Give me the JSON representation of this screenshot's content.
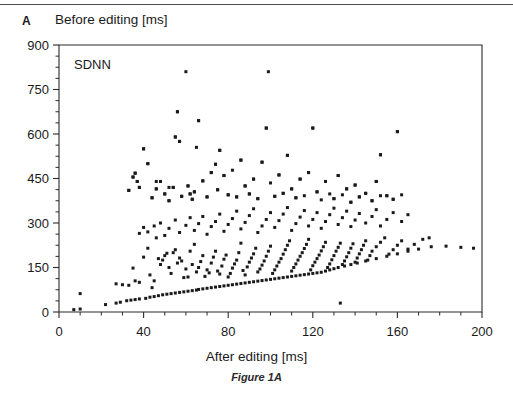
{
  "figure": {
    "panel_letter": "A",
    "caption": "Figure 1A",
    "series_label": "SDNN",
    "y_axis_title": "Before editing [ms]",
    "x_axis_title": "After editing [ms]"
  },
  "chart_data": {
    "type": "scatter",
    "title": "Before editing [ms]",
    "xlabel": "After editing [ms]",
    "ylabel": "Before editing [ms]",
    "series_name": "SDNN",
    "xlim": [
      0,
      200
    ],
    "ylim": [
      0,
      900
    ],
    "xticks": [
      0,
      40,
      80,
      120,
      160,
      200
    ],
    "yticks": [
      0,
      150,
      300,
      450,
      600,
      750,
      900
    ],
    "x_minor_tick_interval": 10,
    "y_minor_tick_interval": 37.5,
    "grid": false,
    "legend": "none",
    "marker": "square",
    "marker_color": "#1a1a1a",
    "marker_size_px": 3,
    "points": [
      [
        7,
        8
      ],
      [
        10,
        10
      ],
      [
        10,
        62
      ],
      [
        22,
        25
      ],
      [
        27,
        30
      ],
      [
        29,
        33
      ],
      [
        32,
        38
      ],
      [
        34,
        40
      ],
      [
        36,
        42
      ],
      [
        38,
        44
      ],
      [
        41,
        46
      ],
      [
        43,
        50
      ],
      [
        45,
        52
      ],
      [
        47,
        55
      ],
      [
        49,
        58
      ],
      [
        51,
        60
      ],
      [
        53,
        62
      ],
      [
        55,
        64
      ],
      [
        57,
        66
      ],
      [
        59,
        68
      ],
      [
        61,
        70
      ],
      [
        63,
        72
      ],
      [
        65,
        74
      ],
      [
        66,
        76
      ],
      [
        68,
        78
      ],
      [
        70,
        80
      ],
      [
        72,
        82
      ],
      [
        74,
        84
      ],
      [
        76,
        86
      ],
      [
        78,
        88
      ],
      [
        80,
        90
      ],
      [
        82,
        92
      ],
      [
        84,
        94
      ],
      [
        86,
        96
      ],
      [
        88,
        98
      ],
      [
        90,
        100
      ],
      [
        92,
        102
      ],
      [
        94,
        104
      ],
      [
        96,
        106
      ],
      [
        98,
        108
      ],
      [
        100,
        110
      ],
      [
        102,
        112
      ],
      [
        104,
        114
      ],
      [
        106,
        116
      ],
      [
        108,
        118
      ],
      [
        110,
        120
      ],
      [
        112,
        122
      ],
      [
        114,
        124
      ],
      [
        116,
        126
      ],
      [
        118,
        128
      ],
      [
        120,
        130
      ],
      [
        122,
        132
      ],
      [
        124,
        134
      ],
      [
        126,
        138
      ],
      [
        128,
        142
      ],
      [
        130,
        146
      ],
      [
        132,
        150
      ],
      [
        135,
        155
      ],
      [
        138,
        160
      ],
      [
        141,
        165
      ],
      [
        145,
        172
      ],
      [
        150,
        180
      ],
      [
        155,
        188
      ],
      [
        160,
        196
      ],
      [
        165,
        205
      ],
      [
        170,
        212
      ],
      [
        176,
        220
      ],
      [
        183,
        222
      ],
      [
        190,
        218
      ],
      [
        196,
        215
      ],
      [
        27,
        95
      ],
      [
        30,
        92
      ],
      [
        33,
        90
      ],
      [
        35,
        148
      ],
      [
        36,
        105
      ],
      [
        38,
        100
      ],
      [
        40,
        185
      ],
      [
        42,
        215
      ],
      [
        43,
        125
      ],
      [
        44,
        82
      ],
      [
        45,
        105
      ],
      [
        46,
        250
      ],
      [
        47,
        180
      ],
      [
        48,
        160
      ],
      [
        49,
        175
      ],
      [
        50,
        190
      ],
      [
        51,
        198
      ],
      [
        52,
        150
      ],
      [
        53,
        130
      ],
      [
        54,
        200
      ],
      [
        55,
        210
      ],
      [
        56,
        165
      ],
      [
        57,
        182
      ],
      [
        58,
        172
      ],
      [
        59,
        116
      ],
      [
        60,
        145
      ],
      [
        61,
        118
      ],
      [
        62,
        205
      ],
      [
        63,
        160
      ],
      [
        64,
        228
      ],
      [
        65,
        135
      ],
      [
        66,
        150
      ],
      [
        67,
        170
      ],
      [
        68,
        190
      ],
      [
        69,
        120
      ],
      [
        70,
        142
      ],
      [
        71,
        132
      ],
      [
        72,
        165
      ],
      [
        73,
        185
      ],
      [
        74,
        205
      ],
      [
        75,
        138
      ],
      [
        76,
        128
      ],
      [
        77,
        155
      ],
      [
        78,
        178
      ],
      [
        79,
        192
      ],
      [
        80,
        118
      ],
      [
        81,
        130
      ],
      [
        82,
        148
      ],
      [
        83,
        162
      ],
      [
        84,
        175
      ],
      [
        85,
        200
      ],
      [
        86,
        232
      ],
      [
        87,
        140
      ],
      [
        88,
        125
      ],
      [
        89,
        152
      ],
      [
        90,
        168
      ],
      [
        91,
        182
      ],
      [
        92,
        196
      ],
      [
        93,
        215
      ],
      [
        94,
        135
      ],
      [
        95,
        145
      ],
      [
        96,
        158
      ],
      [
        97,
        172
      ],
      [
        98,
        188
      ],
      [
        99,
        205
      ],
      [
        100,
        222
      ],
      [
        101,
        130
      ],
      [
        102,
        142
      ],
      [
        103,
        155
      ],
      [
        104,
        168
      ],
      [
        105,
        180
      ],
      [
        106,
        195
      ],
      [
        107,
        210
      ],
      [
        108,
        225
      ],
      [
        109,
        240
      ],
      [
        110,
        138
      ],
      [
        111,
        150
      ],
      [
        112,
        162
      ],
      [
        113,
        175
      ],
      [
        114,
        188
      ],
      [
        115,
        200
      ],
      [
        116,
        214
      ],
      [
        117,
        228
      ],
      [
        118,
        245
      ],
      [
        119,
        142
      ],
      [
        120,
        156
      ],
      [
        121,
        168
      ],
      [
        122,
        180
      ],
      [
        123,
        192
      ],
      [
        124,
        206
      ],
      [
        125,
        220
      ],
      [
        126,
        235
      ],
      [
        127,
        150
      ],
      [
        128,
        162
      ],
      [
        129,
        176
      ],
      [
        130,
        190
      ],
      [
        131,
        205
      ],
      [
        132,
        218
      ],
      [
        133,
        232
      ],
      [
        134,
        160
      ],
      [
        135,
        172
      ],
      [
        136,
        186
      ],
      [
        137,
        200
      ],
      [
        138,
        215
      ],
      [
        139,
        230
      ],
      [
        140,
        168
      ],
      [
        141,
        182
      ],
      [
        142,
        196
      ],
      [
        143,
        210
      ],
      [
        144,
        225
      ],
      [
        145,
        240
      ],
      [
        146,
        175
      ],
      [
        147,
        190
      ],
      [
        148,
        205
      ],
      [
        150,
        220
      ],
      [
        152,
        235
      ],
      [
        154,
        250
      ],
      [
        156,
        195
      ],
      [
        158,
        210
      ],
      [
        160,
        225
      ],
      [
        162,
        240
      ],
      [
        165,
        212
      ],
      [
        168,
        228
      ],
      [
        172,
        245
      ],
      [
        175,
        250
      ],
      [
        38,
        265
      ],
      [
        40,
        285
      ],
      [
        42,
        270
      ],
      [
        45,
        290
      ],
      [
        48,
        300
      ],
      [
        50,
        258
      ],
      [
        52,
        282
      ],
      [
        55,
        310
      ],
      [
        57,
        268
      ],
      [
        60,
        292
      ],
      [
        62,
        318
      ],
      [
        64,
        275
      ],
      [
        66,
        298
      ],
      [
        68,
        322
      ],
      [
        70,
        262
      ],
      [
        72,
        288
      ],
      [
        74,
        305
      ],
      [
        76,
        330
      ],
      [
        78,
        272
      ],
      [
        80,
        295
      ],
      [
        82,
        315
      ],
      [
        84,
        340
      ],
      [
        86,
        280
      ],
      [
        88,
        302
      ],
      [
        90,
        325
      ],
      [
        92,
        348
      ],
      [
        94,
        268
      ],
      [
        96,
        290
      ],
      [
        98,
        312
      ],
      [
        100,
        335
      ],
      [
        102,
        285
      ],
      [
        104,
        308
      ],
      [
        106,
        330
      ],
      [
        108,
        352
      ],
      [
        110,
        275
      ],
      [
        112,
        298
      ],
      [
        114,
        320
      ],
      [
        116,
        342
      ],
      [
        118,
        290
      ],
      [
        120,
        312
      ],
      [
        122,
        335
      ],
      [
        124,
        282
      ],
      [
        126,
        305
      ],
      [
        128,
        328
      ],
      [
        130,
        350
      ],
      [
        132,
        295
      ],
      [
        134,
        318
      ],
      [
        136,
        340
      ],
      [
        138,
        288
      ],
      [
        140,
        310
      ],
      [
        142,
        332
      ],
      [
        145,
        300
      ],
      [
        148,
        322
      ],
      [
        150,
        345
      ],
      [
        152,
        290
      ],
      [
        155,
        312
      ],
      [
        158,
        335
      ],
      [
        162,
        305
      ],
      [
        165,
        328
      ],
      [
        33,
        410
      ],
      [
        35,
        455
      ],
      [
        36,
        468
      ],
      [
        37,
        440
      ],
      [
        38,
        420
      ],
      [
        40,
        550
      ],
      [
        42,
        500
      ],
      [
        44,
        385
      ],
      [
        46,
        415
      ],
      [
        48,
        440
      ],
      [
        50,
        398
      ],
      [
        52,
        375
      ],
      [
        54,
        420
      ],
      [
        55,
        590
      ],
      [
        56,
        675
      ],
      [
        57,
        575
      ],
      [
        58,
        390
      ],
      [
        60,
        810
      ],
      [
        61,
        425
      ],
      [
        62,
        398
      ],
      [
        63,
        380
      ],
      [
        64,
        405
      ],
      [
        65,
        555
      ],
      [
        66,
        645
      ],
      [
        68,
        442
      ],
      [
        70,
        388
      ],
      [
        72,
        470
      ],
      [
        74,
        498
      ],
      [
        75,
        412
      ],
      [
        76,
        545
      ],
      [
        78,
        460
      ],
      [
        80,
        395
      ],
      [
        82,
        478
      ],
      [
        84,
        388
      ],
      [
        86,
        512
      ],
      [
        88,
        425
      ],
      [
        90,
        398
      ],
      [
        92,
        448
      ],
      [
        94,
        382
      ],
      [
        96,
        505
      ],
      [
        98,
        620
      ],
      [
        100,
        435
      ],
      [
        102,
        390
      ],
      [
        104,
        462
      ],
      [
        106,
        400
      ],
      [
        108,
        528
      ],
      [
        110,
        415
      ],
      [
        112,
        385
      ],
      [
        114,
        448
      ],
      [
        116,
        392
      ],
      [
        118,
        470
      ],
      [
        120,
        620
      ],
      [
        122,
        405
      ],
      [
        124,
        378
      ],
      [
        126,
        440
      ],
      [
        128,
        398
      ],
      [
        130,
        382
      ],
      [
        132,
        460
      ],
      [
        134,
        395
      ],
      [
        136,
        415
      ],
      [
        138,
        370
      ],
      [
        140,
        428
      ],
      [
        142,
        388
      ],
      [
        145,
        400
      ],
      [
        148,
        375
      ],
      [
        150,
        440
      ],
      [
        152,
        530
      ],
      [
        155,
        392
      ],
      [
        158,
        380
      ],
      [
        160,
        608
      ],
      [
        162,
        395
      ],
      [
        133,
        30
      ],
      [
        99,
        810
      ],
      [
        56,
        675
      ],
      [
        66,
        645
      ],
      [
        160,
        608
      ],
      [
        98,
        620
      ],
      [
        120,
        620
      ],
      [
        40,
        550
      ],
      [
        55,
        590
      ],
      [
        57,
        575
      ],
      [
        76,
        545
      ],
      [
        152,
        530
      ],
      [
        108,
        528
      ],
      [
        86,
        512
      ],
      [
        96,
        505
      ],
      [
        42,
        500
      ],
      [
        74,
        498
      ],
      [
        72,
        470
      ],
      [
        118,
        470
      ],
      [
        104,
        462
      ],
      [
        132,
        460
      ],
      [
        78,
        460
      ],
      [
        36,
        468
      ],
      [
        35,
        455
      ],
      [
        92,
        448
      ],
      [
        114,
        448
      ],
      [
        150,
        440
      ],
      [
        37,
        440
      ],
      [
        46,
        440
      ],
      [
        68,
        442
      ],
      [
        140,
        428
      ],
      [
        88,
        425
      ],
      [
        61,
        425
      ],
      [
        38,
        420
      ],
      [
        52,
        420
      ],
      [
        110,
        415
      ],
      [
        136,
        415
      ],
      [
        46,
        415
      ],
      [
        64,
        405
      ],
      [
        122,
        405
      ],
      [
        33,
        410
      ],
      [
        75,
        412
      ],
      [
        90,
        398
      ],
      [
        50,
        398
      ],
      [
        62,
        398
      ],
      [
        102,
        390
      ],
      [
        58,
        390
      ],
      [
        84,
        388
      ],
      [
        70,
        388
      ],
      [
        142,
        388
      ],
      [
        106,
        400
      ],
      [
        145,
        400
      ],
      [
        152,
        392
      ],
      [
        155,
        392
      ],
      [
        158,
        380
      ],
      [
        63,
        380
      ],
      [
        54,
        420
      ],
      [
        48,
        440
      ],
      [
        44,
        385
      ],
      [
        80,
        395
      ],
      [
        94,
        382
      ],
      [
        130,
        382
      ],
      [
        112,
        385
      ],
      [
        148,
        375
      ],
      [
        52,
        375
      ],
      [
        138,
        370
      ]
    ]
  }
}
